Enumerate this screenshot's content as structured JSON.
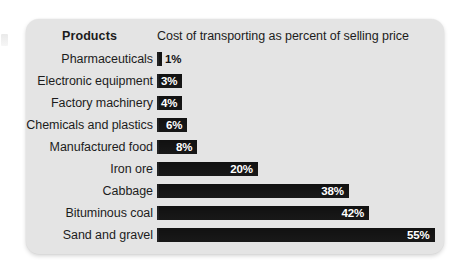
{
  "chart_data": {
    "type": "bar",
    "orientation": "horizontal",
    "title": "",
    "xlabel": "Cost of transporting as percent of selling price",
    "ylabel": "Products",
    "categories": [
      "Pharmaceuticals",
      "Electronic equipment",
      "Factory machinery",
      "Chemicals and plastics",
      "Manufactured food",
      "Iron ore",
      "Cabbage",
      "Bituminous coal",
      "Sand and gravel"
    ],
    "values": [
      1,
      3,
      4,
      6,
      8,
      20,
      38,
      42,
      55
    ],
    "value_labels": [
      "1%",
      "3%",
      "4%",
      "6%",
      "8%",
      "20%",
      "38%",
      "42%",
      "55%"
    ],
    "unit": "%",
    "xlim": [
      0,
      55
    ],
    "grid": false,
    "legend": false,
    "bar_color": "#111111",
    "panel_color": "#e4e4e4",
    "label_inside_color": "#ffffff",
    "label_outside_color": "#111111"
  },
  "header": {
    "products_label": "Products",
    "measure_label": "Cost of transporting as percent of selling price"
  },
  "rows": [
    {
      "label": "Pharmaceuticals",
      "value": 1,
      "value_label": "1%",
      "inside": false
    },
    {
      "label": "Electronic equipment",
      "value": 3,
      "value_label": "3%",
      "inside": true
    },
    {
      "label": "Factory machinery",
      "value": 4,
      "value_label": "4%",
      "inside": true
    },
    {
      "label": "Chemicals and plastics",
      "value": 6,
      "value_label": "6%",
      "inside": true
    },
    {
      "label": "Manufactured food",
      "value": 8,
      "value_label": "8%",
      "inside": true
    },
    {
      "label": "Iron ore",
      "value": 20,
      "value_label": "20%",
      "inside": true
    },
    {
      "label": "Cabbage",
      "value": 38,
      "value_label": "38%",
      "inside": true
    },
    {
      "label": "Bituminous coal",
      "value": 42,
      "value_label": "42%",
      "inside": true
    },
    {
      "label": "Sand and gravel",
      "value": 55,
      "value_label": "55%",
      "inside": true
    }
  ],
  "scale": {
    "px_per_percent": 5.05,
    "min_bar_width": 5
  }
}
